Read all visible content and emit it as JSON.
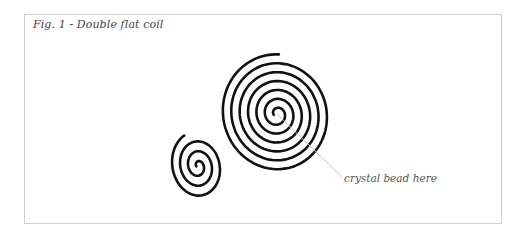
{
  "figure": {
    "caption": "Fig. 1 - Double flat coil",
    "callout": "crystal bead here",
    "colors": {
      "border": "#cfcfcf",
      "stroke": "#111111",
      "leader": "#c8c8c8",
      "text": "#444444"
    },
    "spirals": [
      {
        "name": "small-coil",
        "cx": 198,
        "cy": 166,
        "turns": 3.2,
        "max_rx": 27,
        "max_ry": 34,
        "tilt": -10
      },
      {
        "name": "large-coil",
        "cx": 277,
        "cy": 114,
        "turns": 6.3,
        "max_rx": 56,
        "max_ry": 60,
        "tilt": -15
      }
    ]
  }
}
